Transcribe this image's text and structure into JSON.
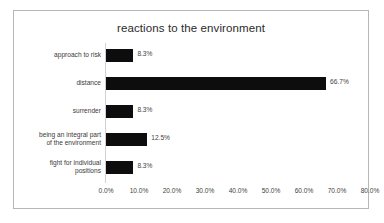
{
  "chart_data": {
    "type": "bar",
    "orientation": "horizontal",
    "title": "reactions to the environment",
    "xlabel": "",
    "ylabel": "",
    "grid": false,
    "legend": "none",
    "xlim": [
      0,
      80
    ],
    "categories": [
      "approach to risk",
      "distance",
      "surrender",
      "being an integral part of the environment",
      "fight for individual positions"
    ],
    "category_lines": [
      [
        "approach to risk"
      ],
      [
        "distance"
      ],
      [
        "surrender"
      ],
      [
        "being an integral part",
        "of the environment"
      ],
      [
        "fight for individual",
        "positions"
      ]
    ],
    "values": [
      8.3,
      66.7,
      8.3,
      12.5,
      8.3
    ],
    "value_labels": [
      "8.3%",
      "66.7%",
      "8.3%",
      "12.5%",
      "8.3%"
    ],
    "xticks": [
      0,
      10,
      20,
      30,
      40,
      50,
      60,
      70,
      80
    ],
    "xtick_labels": [
      "0.0%",
      "10.0%",
      "20.0%",
      "30.0%",
      "40.0%",
      "50.0%",
      "60.0%",
      "70.0%",
      "80.0%"
    ],
    "bar_color": "#0d0d0d",
    "border_color": "#b6b6b6",
    "text_color": "#3f3f3f"
  }
}
